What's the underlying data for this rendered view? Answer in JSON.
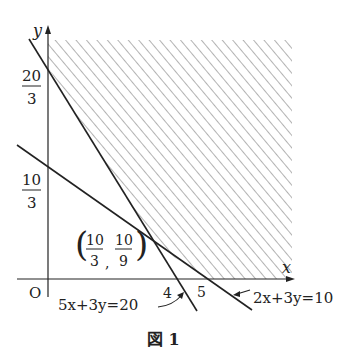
{
  "figure": {
    "caption": "図 1",
    "axes": {
      "x_label": "x",
      "y_label": "y",
      "origin_label": "O",
      "x_ticks": [
        "4",
        "5"
      ],
      "y_ticks": [
        {
          "num": "20",
          "den": "3"
        },
        {
          "num": "10",
          "den": "3"
        }
      ]
    },
    "lines": [
      {
        "equation": "5x+3y=20",
        "x_intercept": 4,
        "y_intercept": "20/3"
      },
      {
        "equation": "2x+3y=10",
        "x_intercept": 5,
        "y_intercept": "10/3"
      }
    ],
    "intersection": {
      "x_num": "10",
      "x_den": "3",
      "y_num": "10",
      "y_den": "9",
      "sep": ","
    },
    "region": "shaded (hatched) feasible region above both lines, x ≥ 0",
    "colors": {
      "ink": "#222222",
      "hatch": "#888888",
      "background": "#ffffff"
    }
  }
}
